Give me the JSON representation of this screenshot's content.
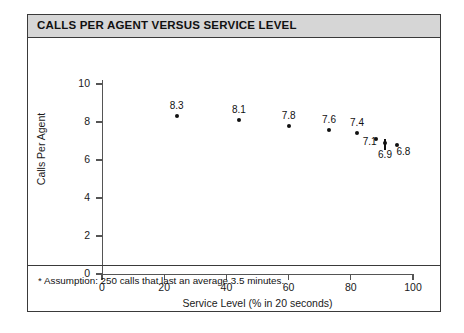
{
  "figure": {
    "title": "CALLS PER AGENT VERSUS SERVICE LEVEL",
    "footnote": "* Assumption:  250 calls that last an average 3.5 minutes.",
    "title_bg": "#d6d6d6",
    "border_color": "#3a3a3a",
    "marker_color": "#111111"
  },
  "chart_data": {
    "type": "scatter",
    "title": "CALLS PER AGENT VERSUS SERVICE LEVEL",
    "xlabel": "Service Level (% in 20 seconds)",
    "ylabel": "Calls Per Agent",
    "xlim": [
      0,
      100
    ],
    "ylim": [
      0,
      10
    ],
    "xticks": [
      0,
      20,
      40,
      60,
      80,
      100
    ],
    "yticks": [
      0,
      2,
      4,
      6,
      8,
      10
    ],
    "xtick_labels": [
      "0",
      "20",
      "40",
      "60",
      "80",
      "100"
    ],
    "ytick_labels": [
      "0",
      "2",
      "4",
      "6",
      "8",
      "10"
    ],
    "grid": false,
    "legend": null,
    "x": [
      24,
      44,
      60,
      73,
      82,
      88,
      91,
      95
    ],
    "y": [
      8.3,
      8.1,
      7.8,
      7.6,
      7.4,
      7.1,
      6.9,
      6.8
    ],
    "point_labels": [
      "8.3",
      "8.1",
      "7.8",
      "7.6",
      "7.4",
      "7.1",
      "6.9",
      "6.8"
    ],
    "label_positions": [
      "above",
      "above",
      "above",
      "above",
      "above",
      "left",
      "below",
      "right"
    ],
    "annotations": [
      {
        "type": "vertical-connector",
        "x": 91,
        "y_top": 7.1,
        "y_bottom": 6.5
      }
    ],
    "footnote": "* Assumption:  250 calls that last an average 3.5 minutes."
  }
}
